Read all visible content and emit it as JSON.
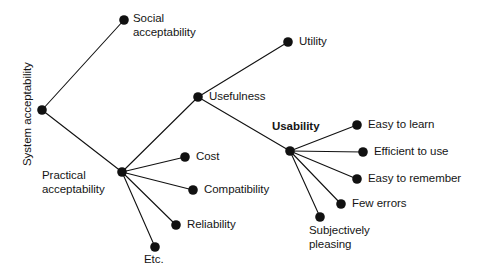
{
  "diagram": {
    "type": "tree",
    "background_color": "#ffffff",
    "line_color": "#111111",
    "node_color": "#111111",
    "text_color": "#151515",
    "nodes": [
      {
        "id": "system_acceptability",
        "label": "System acceptability",
        "x": 42,
        "y": 110,
        "label_x": 21,
        "label_y": 166,
        "rotated": true,
        "bold": false,
        "lines": [
          "System acceptability"
        ]
      },
      {
        "id": "social_acceptability",
        "label": "Social acceptability",
        "x": 124,
        "y": 20,
        "label_x": 133,
        "label_y": 12,
        "rotated": false,
        "bold": false,
        "lines": [
          "Social",
          "acceptability"
        ]
      },
      {
        "id": "practical_acceptability",
        "label": "Practical acceptability",
        "x": 122,
        "y": 172,
        "label_x": 42,
        "label_y": 169,
        "rotated": false,
        "bold": false,
        "lines": [
          "Practical",
          "acceptability"
        ]
      },
      {
        "id": "usefulness",
        "label": "Usefulness",
        "x": 198,
        "y": 97,
        "label_x": 209,
        "label_y": 90,
        "rotated": false,
        "bold": false,
        "lines": [
          "Usefulness"
        ]
      },
      {
        "id": "cost",
        "label": "Cost",
        "x": 185,
        "y": 157,
        "label_x": 196,
        "label_y": 150,
        "rotated": false,
        "bold": false,
        "lines": [
          "Cost"
        ]
      },
      {
        "id": "compatibility",
        "label": "Compatibility",
        "x": 193,
        "y": 190,
        "label_x": 204,
        "label_y": 183,
        "rotated": false,
        "bold": false,
        "lines": [
          "Compatibility"
        ]
      },
      {
        "id": "reliability",
        "label": "Reliability",
        "x": 176,
        "y": 225,
        "label_x": 187,
        "label_y": 218,
        "rotated": false,
        "bold": false,
        "lines": [
          "Reliability"
        ]
      },
      {
        "id": "etc",
        "label": "Etc.",
        "x": 155,
        "y": 247,
        "label_x": 144,
        "label_y": 253,
        "rotated": false,
        "bold": false,
        "lines": [
          "Etc."
        ]
      },
      {
        "id": "utility",
        "label": "Utility",
        "x": 288,
        "y": 42,
        "label_x": 299,
        "label_y": 35,
        "rotated": false,
        "bold": false,
        "lines": [
          "Utility"
        ]
      },
      {
        "id": "usability",
        "label": "Usability",
        "x": 290,
        "y": 151,
        "label_x": 272,
        "label_y": 120,
        "rotated": false,
        "bold": true,
        "lines": [
          "Usability"
        ]
      },
      {
        "id": "easy_to_learn",
        "label": "Easy to learn",
        "x": 357,
        "y": 125,
        "label_x": 368,
        "label_y": 118,
        "rotated": false,
        "bold": false,
        "lines": [
          "Easy to learn"
        ]
      },
      {
        "id": "efficient_to_use",
        "label": "Efficient to use",
        "x": 363,
        "y": 152,
        "label_x": 374,
        "label_y": 145,
        "rotated": false,
        "bold": false,
        "lines": [
          "Efficient to use"
        ]
      },
      {
        "id": "easy_to_remember",
        "label": "Easy to remember",
        "x": 357,
        "y": 179,
        "label_x": 368,
        "label_y": 172,
        "rotated": false,
        "bold": false,
        "lines": [
          "Easy to remember"
        ]
      },
      {
        "id": "few_errors",
        "label": "Few errors",
        "x": 341,
        "y": 204,
        "label_x": 352,
        "label_y": 197,
        "rotated": false,
        "bold": false,
        "lines": [
          "Few errors"
        ]
      },
      {
        "id": "subjectively_pleasing",
        "label": "Subjectively pleasing",
        "x": 320,
        "y": 217,
        "label_x": 309,
        "label_y": 224,
        "rotated": false,
        "bold": false,
        "lines": [
          "Subjectively",
          "pleasing"
        ]
      }
    ],
    "edges": [
      {
        "from": "system_acceptability",
        "to": "social_acceptability"
      },
      {
        "from": "system_acceptability",
        "to": "practical_acceptability"
      },
      {
        "from": "practical_acceptability",
        "to": "usefulness"
      },
      {
        "from": "practical_acceptability",
        "to": "cost"
      },
      {
        "from": "practical_acceptability",
        "to": "compatibility"
      },
      {
        "from": "practical_acceptability",
        "to": "reliability"
      },
      {
        "from": "practical_acceptability",
        "to": "etc"
      },
      {
        "from": "usefulness",
        "to": "utility"
      },
      {
        "from": "usefulness",
        "to": "usability"
      },
      {
        "from": "usability",
        "to": "easy_to_learn"
      },
      {
        "from": "usability",
        "to": "efficient_to_use"
      },
      {
        "from": "usability",
        "to": "easy_to_remember"
      },
      {
        "from": "usability",
        "to": "few_errors"
      },
      {
        "from": "usability",
        "to": "subjectively_pleasing"
      }
    ],
    "node_radius": 4.8
  }
}
